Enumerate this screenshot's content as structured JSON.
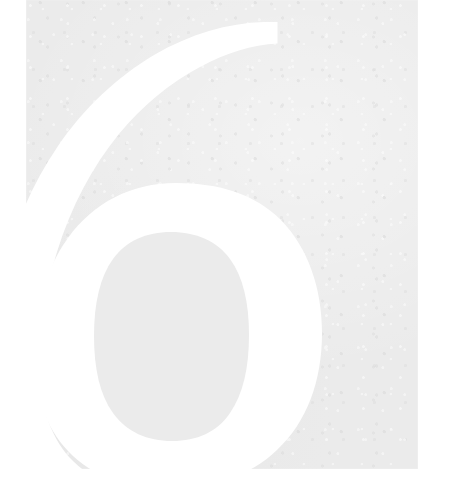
{
  "document": {
    "type": "book-chapter-opener",
    "page_label": "6",
    "description": "Scanned book page with a large white chapter number reversed out of a light grey field"
  },
  "page": {
    "background_color": "#ffffff",
    "field_color": "#ebebeb",
    "field": {
      "left": 26,
      "top": 0,
      "width": 392,
      "height": 469
    }
  },
  "numeral": {
    "value": "6",
    "color": "#ffffff",
    "style": "didone-serif",
    "bounds": {
      "left": 25,
      "top": 42,
      "right": 318,
      "bottom": 465
    }
  },
  "canvas": {
    "width": 449,
    "height": 504
  }
}
